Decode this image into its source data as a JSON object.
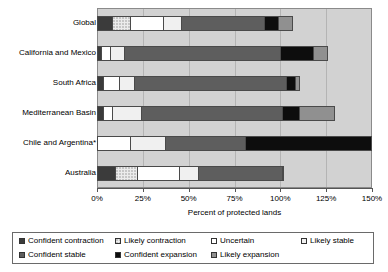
{
  "chart_data": {
    "type": "bar",
    "orientation": "horizontal",
    "stacked": true,
    "title": "",
    "xlabel": "Percent of protected lands",
    "ylabel": "",
    "xlim": [
      0,
      150
    ],
    "xticks": [
      0,
      25,
      50,
      75,
      100,
      125,
      150
    ],
    "xtick_labels": [
      "0%",
      "25%",
      "50%",
      "75%",
      "100%",
      "125%",
      "150%"
    ],
    "grid": true,
    "legend_position": "bottom",
    "categories": [
      "Global",
      "California and Mexico",
      "South Africa",
      "Mediterranean Basin",
      "Chile and Argentina*",
      "Australia"
    ],
    "series": [
      {
        "name": "Confident contraction",
        "color": "#3b3b3b",
        "values": [
          8,
          2,
          3,
          3,
          0,
          10
        ]
      },
      {
        "name": "Likely contraction",
        "color": "#ececec",
        "values": [
          10,
          0,
          0,
          0,
          0,
          12
        ]
      },
      {
        "name": "Uncertain",
        "color": "#ffffff",
        "values": [
          18,
          5,
          9,
          5,
          18,
          23
        ]
      },
      {
        "name": "Likely stable",
        "color": "#f0f0f0",
        "values": [
          10,
          8,
          8,
          16,
          19,
          10
        ]
      },
      {
        "name": "Confident stable",
        "color": "#5e5e5e",
        "values": [
          45,
          85,
          83,
          77,
          44,
          46
        ]
      },
      {
        "name": "Confident expansion",
        "color": "#0d0d0d",
        "values": [
          8,
          18,
          5,
          9,
          69,
          1
        ]
      },
      {
        "name": "Likely expansion",
        "color": "#909090",
        "values": [
          8,
          8,
          3,
          20,
          0,
          0
        ]
      }
    ],
    "row_totals": [
      107,
      126,
      111,
      130,
      150,
      102
    ]
  },
  "legend": {
    "items": [
      {
        "label": "Confident contraction",
        "swatch": "confident-contraction-swatch"
      },
      {
        "label": "Likely contraction",
        "swatch": "likely-contraction-swatch"
      },
      {
        "label": "Uncertain",
        "swatch": "uncertain-swatch"
      },
      {
        "label": "Likely stable",
        "swatch": "likely-stable-swatch"
      },
      {
        "label": "Confident stable",
        "swatch": "confident-stable-swatch"
      },
      {
        "label": "Confident expansion",
        "swatch": "confident-expansion-swatch"
      },
      {
        "label": "Likely expansion",
        "swatch": "likely-expansion-swatch"
      }
    ]
  }
}
